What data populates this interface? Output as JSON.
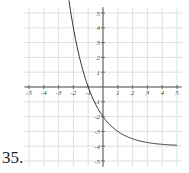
{
  "problem": {
    "number": "35."
  },
  "chart_data": {
    "type": "line",
    "title": "",
    "xlabel": "",
    "ylabel": "",
    "xlim": [
      -5,
      5
    ],
    "ylim": [
      -5,
      5
    ],
    "grid": true,
    "x_ticks": [
      "-5",
      "-4",
      "-3",
      "-2",
      "-1",
      "1",
      "2",
      "3",
      "4",
      "5"
    ],
    "y_ticks": [
      "5",
      "4",
      "3",
      "2",
      "1",
      "-1",
      "-2",
      "-3",
      "-4",
      "-5"
    ],
    "series": [
      {
        "name": "exponential decay curve",
        "function": "y = 2(0.5)^x - 4",
        "asymptote": -4,
        "x": [
          -2.3,
          -2,
          -1.5,
          -1,
          -0.5,
          0,
          0.5,
          1,
          2,
          3,
          4,
          5
        ],
        "y": [
          5.85,
          4,
          1.66,
          0,
          -1.17,
          -2,
          -2.59,
          -3,
          -3.5,
          -3.75,
          -3.88,
          -3.94
        ]
      }
    ],
    "colors": {
      "curve": "#333333",
      "grid": "#d8d8d8",
      "axis": "#555555"
    }
  }
}
